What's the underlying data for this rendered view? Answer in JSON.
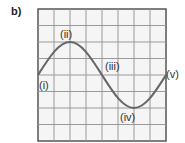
{
  "part_label": "b)",
  "grid": {
    "x": 38,
    "y": 9,
    "width": 128,
    "height": 132,
    "columns": 8,
    "rows": 8,
    "line_color": "#9a9a9a",
    "border_color": "#555555",
    "background": "#f5f5f5"
  },
  "curve": {
    "type": "sine",
    "color": "#666666",
    "amplitude_grid_units": 2,
    "wavelength_grid_units": 8,
    "start_phase": "zero-crossing-rising"
  },
  "points": [
    {
      "label": "(i)",
      "description": "start, zero crossing"
    },
    {
      "label": "(ii)",
      "description": "crest"
    },
    {
      "label": "(iii)",
      "description": "zero crossing, falling"
    },
    {
      "label": "(iv)",
      "description": "trough"
    },
    {
      "label": "(v)",
      "description": "end, zero crossing"
    }
  ]
}
